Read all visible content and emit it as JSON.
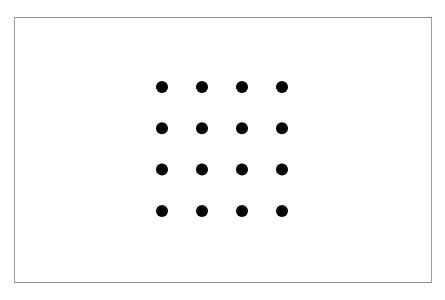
{
  "figure": {
    "rows": 4,
    "cols": 4,
    "dot_color": "#000000",
    "frame_color": "#8a8a8a",
    "background_color": "#ffffff"
  }
}
